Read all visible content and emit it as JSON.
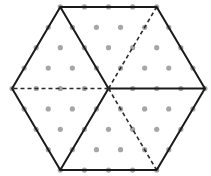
{
  "diagram": {
    "lattice": {
      "side_units": 4,
      "rows": 9
    },
    "hexagon_vertices": [
      "top-left",
      "top-right",
      "right",
      "bottom-right",
      "bottom-left",
      "left"
    ],
    "interior_segments": [
      {
        "from": "center",
        "to": "top-left",
        "style": "solid"
      },
      {
        "from": "center",
        "to": "bottom-left",
        "style": "solid"
      },
      {
        "from": "center",
        "to": "right",
        "style": "solid"
      },
      {
        "from": "center",
        "to": "left",
        "style": "dashed"
      },
      {
        "from": "center",
        "to": "top-right",
        "style": "dashed"
      },
      {
        "from": "center",
        "to": "bottom-right",
        "style": "dashed"
      }
    ],
    "colors": {
      "line": "#1a1a1a",
      "dot": "#a6a6a6",
      "background": "#ffffff"
    }
  }
}
